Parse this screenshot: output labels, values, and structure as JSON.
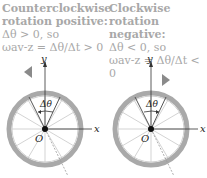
{
  "panels": [
    {
      "title_line1": "Counterclockwise",
      "title_line2": "rotation positive:",
      "condition": "Δθ > 0, so",
      "omega_expr": "ωav-z = Δθ/Δt > 0",
      "rotation_direction": "counterclockwise",
      "axis_labels": {
        "x": "x",
        "y": "y",
        "origin": "O"
      },
      "angle_label": "Δθ",
      "arrow_icon": "curved-arrow-left"
    },
    {
      "title_line1": "Clockwise",
      "title_line2": "rotation negative:",
      "condition": "Δθ < 0, so",
      "omega_expr": "ωav-z = Δθ/Δt < 0",
      "rotation_direction": "clockwise",
      "axis_labels": {
        "x": "x",
        "y": "y",
        "origin": "O"
      },
      "angle_label": "Δθ",
      "arrow_icon": "curved-arrow-right"
    }
  ],
  "colors": {
    "caption_text": "#a8a8a8",
    "wheel_rim": "#a9a9a9",
    "spokes": "#c8c8c8",
    "axis": "#333333",
    "arrow": "#8a8a8a"
  }
}
